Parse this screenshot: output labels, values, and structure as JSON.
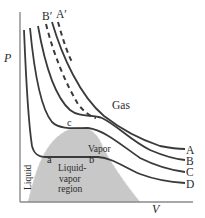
{
  "diagram": {
    "axes": {
      "y_label": "P",
      "x_label": "V"
    },
    "isotherms": [
      {
        "id": "A",
        "label": "A",
        "style": "solid"
      },
      {
        "id": "B",
        "label": "B",
        "style": "solid"
      },
      {
        "id": "C",
        "label": "C",
        "style": "solid",
        "note": "critical isotherm"
      },
      {
        "id": "D",
        "label": "D",
        "style": "solid"
      }
    ],
    "ideal_curves": [
      {
        "id": "A'",
        "label": "A′",
        "style": "dashed"
      },
      {
        "id": "B'",
        "label": "B′",
        "style": "dashed"
      }
    ],
    "points": {
      "critical": "c",
      "liquid_end": "a",
      "vapor_end": "b"
    },
    "regions": {
      "gas": "Gas",
      "vapor": "Vapor",
      "liquid": "Liquid",
      "liquid_vapor_line1": "Liquid-",
      "liquid_vapor_line2": "vapor",
      "liquid_vapor_line3": "region"
    },
    "colors": {
      "curve": "#3a3a3a",
      "axis": "#8a8a8a",
      "dome_fill": "#c8c8c8",
      "text": "#2a2a2a"
    }
  }
}
